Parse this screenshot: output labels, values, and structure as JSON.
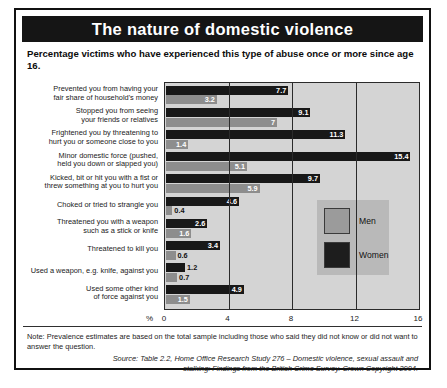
{
  "title": "The nature of domestic violence",
  "subtitle": "Percentage victims who have experienced this type of abuse once or more since age 16.",
  "legend": {
    "men_label": "Men",
    "women_label": "Women"
  },
  "axis": {
    "percent_symbol": "%"
  },
  "note": "Note: Prevalence estimates are based on the total sample including those who said they did not know or did not want to answer the question.",
  "source": "Source: Table 2.2, Home Office Research Study 276 – Domestic violence, sexual assault and stalking: Findings from the British Crime Survey. Crown Copyright 2004.",
  "colors": {
    "title_bar": "#151515",
    "women_bar": "#181818",
    "men_bar": "#8d8d8d",
    "plot_background": "#d4d4d4",
    "legend_background": "#b9b9b9",
    "frame": "#111111"
  },
  "chart_data": {
    "type": "bar",
    "orientation": "horizontal",
    "title": "The nature of domestic violence",
    "subtitle": "Percentage victims who have experienced this type of abuse once or more since age 16.",
    "xlabel": "%",
    "ylabel": "",
    "xlim": [
      0,
      16
    ],
    "xticks": [
      0,
      4,
      8,
      12,
      16
    ],
    "grid": true,
    "legend_position": "inside-right",
    "categories": [
      "Prevented you from having your fair share of household's money",
      "Stopped you from seeing your friends or relatives",
      "Frightened you by threatening to hurt you or someone close to you",
      "Minor domestic force (pushed, held you down or slapped you)",
      "Kicked, bit or hit you with a fist or threw something at you to hurt you",
      "Choked or tried to strangle you",
      "Threatened you with a weapon such as a stick or knife",
      "Threatened to kill you",
      "Used a weapon, e.g. knife, against you",
      "Used some other kind of force against you"
    ],
    "series": [
      {
        "name": "Women",
        "values": [
          7.7,
          9.1,
          11.3,
          15.4,
          9.7,
          4.6,
          2.6,
          3.4,
          1.2,
          4.9
        ]
      },
      {
        "name": "Men",
        "values": [
          3.2,
          7.0,
          1.4,
          5.1,
          5.9,
          0.4,
          1.6,
          0.6,
          0.7,
          1.5
        ]
      }
    ]
  },
  "category_lines": [
    [
      "Prevented you from having your",
      "fair share of household's money"
    ],
    [
      "Stopped you from seeing",
      "your friends or relatives"
    ],
    [
      "Frightened you by threatening to",
      "hurt you or someone close to you"
    ],
    [
      "Minor domestic force (pushed,",
      "held you down or slapped you)"
    ],
    [
      "Kicked, bit or hit you with a fist or",
      "threw something at you to hurt you"
    ],
    [
      "Choked or tried to strangle you"
    ],
    [
      "Threatened you with a weapon",
      "such as a stick or knife"
    ],
    [
      "Threatened to kill you"
    ],
    [
      "Used a weapon, e.g. knife, against you"
    ],
    [
      "Used some other kind",
      "of force against you"
    ]
  ]
}
